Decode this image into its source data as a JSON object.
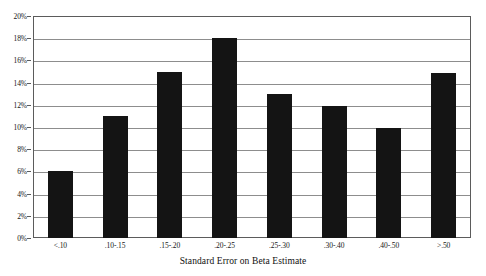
{
  "chart_data": {
    "type": "bar",
    "title": "",
    "subtitle": "",
    "xlabel": "Standard Error on Beta Estimate",
    "ylabel": "",
    "categories": [
      "<.10",
      ".10-.15",
      ".15-.20",
      ".20-.25",
      ".25-.30",
      ".30-.40",
      ".40-.50",
      ">.50"
    ],
    "values": [
      6.0,
      11.0,
      15.0,
      18.0,
      13.0,
      11.9,
      9.9,
      14.9
    ],
    "value_unit": "%",
    "ylim": [
      0,
      20
    ],
    "ytick_step": 2,
    "ytick_labels": [
      "0%",
      "2%",
      "4%",
      "6%",
      "8%",
      "10%",
      "12%",
      "14%",
      "16%",
      "18%",
      "20%"
    ],
    "ytick_values": [
      0,
      2,
      4,
      6,
      8,
      10,
      12,
      14,
      16,
      18,
      20
    ],
    "grid": true,
    "grid_orientation": "horizontal",
    "legend": false,
    "legend_position": "none",
    "bar_color": "#141414",
    "grid_color": "#8d8d8d",
    "frame_color": "#5b5b5b",
    "background_color": "#ffffff",
    "annotations": []
  }
}
